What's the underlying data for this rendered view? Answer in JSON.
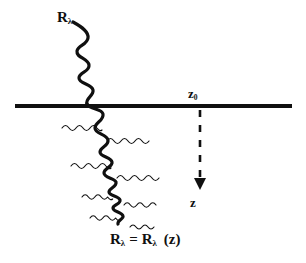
{
  "figure": {
    "background_color": "#ffffff",
    "ink_color": "#101010",
    "width": 306,
    "height": 263
  },
  "labels": {
    "incident_beam": {
      "base": "R",
      "subscript": "λ",
      "full": "Rλ"
    },
    "surface_depth": {
      "base": "z",
      "subscript": "0",
      "full": "z0"
    },
    "depth_axis": {
      "base": "z",
      "full": "z"
    },
    "equation": {
      "left_base": "R",
      "left_subscript": "λ",
      "operator": "=",
      "right_base": "R",
      "right_subscript": "λ",
      "argument": "(z)",
      "full": "Rλ = Rλ (z)"
    }
  },
  "elements": {
    "boundary_line": {
      "name": "surface boundary",
      "x_start": 15,
      "x_end": 292,
      "y": 106,
      "thickness": 4,
      "color": "#101010"
    },
    "depth_arrow": {
      "name": "depth direction arrow",
      "style": "dashed",
      "x": 200,
      "y_start": 110,
      "y_end": 190,
      "dash_count": 5,
      "color": "#101010"
    },
    "incident_wave": {
      "name": "incident wave above surface",
      "thickness": 3.2,
      "color": "#101010"
    },
    "transmitted_wave": {
      "name": "attenuated wave below surface",
      "thickness": 3.2,
      "color": "#101010",
      "note": "wavelength shortens with depth"
    },
    "scattered_waves": {
      "name": "scattered thin waves",
      "thickness": 1.1,
      "color": "#101010",
      "count": 7
    }
  }
}
